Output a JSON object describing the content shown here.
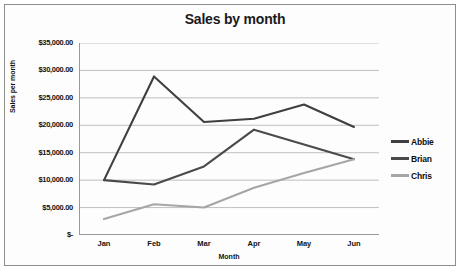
{
  "chart_data": {
    "type": "line",
    "title": "Sales by month",
    "xlabel": "Month",
    "ylabel": "Sales per month",
    "categories": [
      "Jan",
      "Feb",
      "Mar",
      "Apr",
      "May",
      "Jun"
    ],
    "ylim": [
      0,
      35000
    ],
    "ytick_labels": [
      "$35,000.00",
      "$30,000.00",
      "$25,000.00",
      "$20,000.00",
      "$15,000.00",
      "$10,000.00",
      "$5,000.00",
      "$-"
    ],
    "ytick_values": [
      35000,
      30000,
      25000,
      20000,
      15000,
      10000,
      5000,
      0
    ],
    "grid": true,
    "legend_position": "right",
    "series": [
      {
        "name": "Abbie",
        "color": "#3f3f3f",
        "values": [
          10000,
          28900,
          20600,
          21200,
          23800,
          19700
        ]
      },
      {
        "name": "Brian",
        "color": "#4a4a4a",
        "values": [
          10000,
          9200,
          12500,
          19200,
          16500,
          13800
        ]
      },
      {
        "name": "Chris",
        "color": "#a6a6a6",
        "values": [
          2900,
          5600,
          5000,
          8600,
          11300,
          13800
        ]
      }
    ]
  }
}
